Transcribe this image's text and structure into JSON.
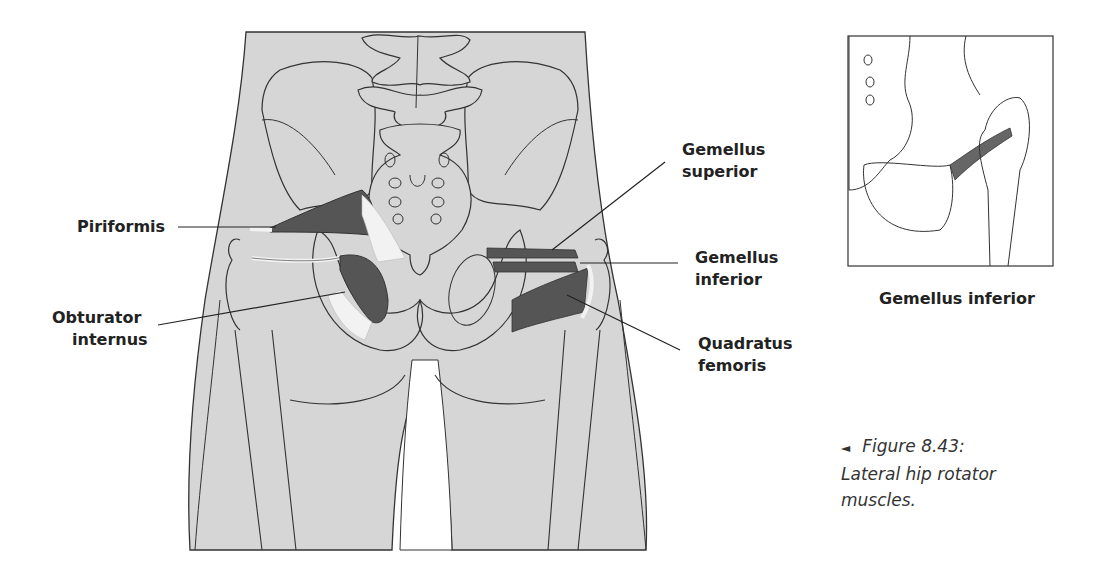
{
  "figure": {
    "main_illustration": "posterior view of pelvis and thighs",
    "labels": {
      "piriformis": "Piriformis",
      "obturator_internus_line1": "Obturator",
      "obturator_internus_line2": "internus",
      "gemellus_superior_line1": "Gemellus",
      "gemellus_superior_line2": "superior",
      "gemellus_inferior_line1": "Gemellus",
      "gemellus_inferior_line2": "inferior",
      "quadratus_femoris_line1": "Quadratus",
      "quadratus_femoris_line2": "femoris"
    },
    "inset": {
      "caption": "Gemellus inferior"
    },
    "caption": {
      "arrow_icon": "◄",
      "line1": "Figure 8.43:",
      "line2": "Lateral hip rotator",
      "line3": "muscles."
    },
    "colors": {
      "skin_fill": "#d6d6d6",
      "outline": "#333333",
      "muscle": "#555555",
      "tendon": "#f2f2f2"
    }
  }
}
